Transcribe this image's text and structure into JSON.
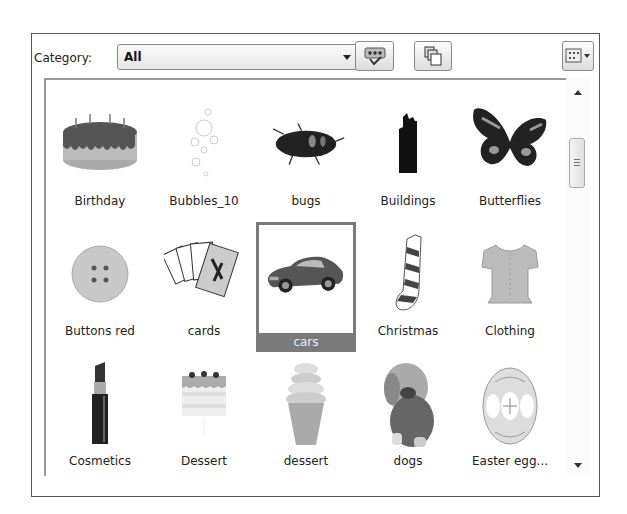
{
  "toolbar": {
    "category_label": "Category:",
    "category_value": "All",
    "buttons": [
      {
        "name": "find-similar-button",
        "icon": "speech-bubble-check-icon"
      },
      {
        "name": "copy-button",
        "icon": "copy-pages-icon"
      },
      {
        "name": "view-options-button",
        "icon": "grid-view-icon"
      }
    ]
  },
  "gallery": {
    "selected_item": "cars",
    "items": [
      {
        "label": "Birthday",
        "icon": "birthday-cake"
      },
      {
        "label": "Bubbles_10",
        "icon": "bubbles"
      },
      {
        "label": "bugs",
        "icon": "beetle"
      },
      {
        "label": "Buildings",
        "icon": "building"
      },
      {
        "label": "Butterflies",
        "icon": "butterfly"
      },
      {
        "label": "Buttons red",
        "icon": "button"
      },
      {
        "label": "cards",
        "icon": "playing-cards"
      },
      {
        "label": "cars",
        "icon": "car"
      },
      {
        "label": "Christmas",
        "icon": "christmas-stocking"
      },
      {
        "label": "Clothing",
        "icon": "blouse"
      },
      {
        "label": "Cosmetics",
        "icon": "lipstick"
      },
      {
        "label": "Dessert",
        "icon": "layer-cake"
      },
      {
        "label": "dessert",
        "icon": "ice-cream-cone"
      },
      {
        "label": "dogs",
        "icon": "puppy"
      },
      {
        "label": "Easter egg...",
        "icon": "easter-egg"
      }
    ]
  },
  "scrollbar": {
    "thumb_position": "upper"
  },
  "colors": {
    "selection": "#7a7a7a",
    "border": "#555555"
  }
}
